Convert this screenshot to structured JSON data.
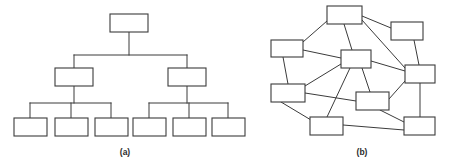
{
  "figure": {
    "background_color": "#ffffff",
    "stroke_color": "#3b3b3b",
    "node_fill_color": "#ffffff",
    "width": 449,
    "height": 165,
    "captions": [
      {
        "id": "caption-a",
        "label": "(a)",
        "x": 125,
        "y": 155
      },
      {
        "id": "caption-b",
        "label": "(b)",
        "x": 362,
        "y": 155
      }
    ],
    "panels": [
      {
        "id": "panel-a",
        "caption": "(a)",
        "diagram_type": "hierarchical-tree",
        "node_count": 9,
        "edge_count": 8,
        "nodes": [
          {
            "id": "a-n1",
            "role": "root",
            "x": 110,
            "y": 14,
            "w": 38,
            "h": 18
          },
          {
            "id": "a-n2",
            "role": "branch",
            "x": 55,
            "y": 68,
            "w": 38,
            "h": 18
          },
          {
            "id": "a-n3",
            "role": "branch",
            "x": 168,
            "y": 68,
            "w": 38,
            "h": 18
          },
          {
            "id": "a-n4",
            "role": "leaf",
            "x": 14,
            "y": 118,
            "w": 33,
            "h": 18
          },
          {
            "id": "a-n5",
            "role": "leaf",
            "x": 55,
            "y": 118,
            "w": 33,
            "h": 18
          },
          {
            "id": "a-n6",
            "role": "leaf",
            "x": 95,
            "y": 118,
            "w": 33,
            "h": 18
          },
          {
            "id": "a-n7",
            "role": "leaf",
            "x": 133,
            "y": 118,
            "w": 33,
            "h": 18
          },
          {
            "id": "a-n8",
            "role": "leaf",
            "x": 173,
            "y": 118,
            "w": 33,
            "h": 18
          },
          {
            "id": "a-n9",
            "role": "leaf",
            "x": 212,
            "y": 118,
            "w": 33,
            "h": 18
          }
        ],
        "trunk_segments": [
          {
            "id": "a-e1",
            "kind": "vertical",
            "x1": 129,
            "y1": 32,
            "x2": 129,
            "y2": 55
          },
          {
            "id": "a-e2",
            "kind": "horizontal",
            "x1": 74,
            "y1": 55,
            "x2": 187,
            "y2": 55
          },
          {
            "id": "a-e3",
            "kind": "vertical",
            "x1": 74,
            "y1": 55,
            "x2": 74,
            "y2": 68
          },
          {
            "id": "a-e4",
            "kind": "vertical",
            "x1": 187,
            "y1": 55,
            "x2": 187,
            "y2": 68
          },
          {
            "id": "a-e5",
            "kind": "vertical",
            "x1": 74,
            "y1": 86,
            "x2": 74,
            "y2": 103
          },
          {
            "id": "a-e6",
            "kind": "horizontal",
            "x1": 30,
            "y1": 103,
            "x2": 111,
            "y2": 103
          },
          {
            "id": "a-e7",
            "kind": "vertical",
            "x1": 30,
            "y1": 103,
            "x2": 30,
            "y2": 118
          },
          {
            "id": "a-e8",
            "kind": "vertical",
            "x1": 71,
            "y1": 103,
            "x2": 71,
            "y2": 118
          },
          {
            "id": "a-e9",
            "kind": "vertical",
            "x1": 111,
            "y1": 103,
            "x2": 111,
            "y2": 118
          },
          {
            "id": "a-e10",
            "kind": "vertical",
            "x1": 187,
            "y1": 86,
            "x2": 187,
            "y2": 103
          },
          {
            "id": "a-e11",
            "kind": "horizontal",
            "x1": 149,
            "y1": 103,
            "x2": 228,
            "y2": 103
          },
          {
            "id": "a-e12",
            "kind": "vertical",
            "x1": 149,
            "y1": 103,
            "x2": 149,
            "y2": 118
          },
          {
            "id": "a-e13",
            "kind": "vertical",
            "x1": 189,
            "y1": 103,
            "x2": 189,
            "y2": 118
          },
          {
            "id": "a-e14",
            "kind": "vertical",
            "x1": 228,
            "y1": 103,
            "x2": 228,
            "y2": 118
          }
        ]
      },
      {
        "id": "panel-b",
        "caption": "(b)",
        "diagram_type": "mesh-network",
        "node_count": 9,
        "edge_count": 17,
        "nodes": [
          {
            "id": "b-n1",
            "role": "mesh-node",
            "x": 327,
            "y": 6,
            "w": 35,
            "h": 18
          },
          {
            "id": "b-n2",
            "role": "mesh-node",
            "x": 391,
            "y": 22,
            "w": 32,
            "h": 18
          },
          {
            "id": "b-n3",
            "role": "mesh-node",
            "x": 271,
            "y": 40,
            "w": 32,
            "h": 17
          },
          {
            "id": "b-n4",
            "role": "mesh-node",
            "x": 341,
            "y": 50,
            "w": 30,
            "h": 18
          },
          {
            "id": "b-n5",
            "role": "mesh-node",
            "x": 405,
            "y": 65,
            "w": 30,
            "h": 18
          },
          {
            "id": "b-n6",
            "role": "mesh-node",
            "x": 271,
            "y": 84,
            "w": 34,
            "h": 18
          },
          {
            "id": "b-n7",
            "role": "mesh-node",
            "x": 356,
            "y": 92,
            "w": 33,
            "h": 18
          },
          {
            "id": "b-n8",
            "role": "mesh-node",
            "x": 310,
            "y": 117,
            "w": 33,
            "h": 18
          },
          {
            "id": "b-n9",
            "role": "mesh-node",
            "x": 404,
            "y": 117,
            "w": 31,
            "h": 18
          }
        ],
        "edges": [
          {
            "id": "b-e1",
            "from": "b-n1",
            "to": "b-n3",
            "x1": 327,
            "y1": 21,
            "x2": 303,
            "y2": 42
          },
          {
            "id": "b-e2",
            "from": "b-n1",
            "to": "b-n4",
            "x1": 344,
            "y1": 24,
            "x2": 352,
            "y2": 50
          },
          {
            "id": "b-e3",
            "from": "b-n1",
            "to": "b-n2",
            "x1": 362,
            "y1": 16,
            "x2": 391,
            "y2": 28
          },
          {
            "id": "b-e4",
            "from": "b-n1",
            "to": "b-n5",
            "x1": 362,
            "y1": 20,
            "x2": 405,
            "y2": 68
          },
          {
            "id": "b-e5",
            "from": "b-n2",
            "to": "b-n5",
            "x1": 414,
            "y1": 40,
            "x2": 419,
            "y2": 65
          },
          {
            "id": "b-e6",
            "from": "b-n3",
            "to": "b-n4",
            "x1": 303,
            "y1": 50,
            "x2": 341,
            "y2": 58
          },
          {
            "id": "b-e7",
            "from": "b-n3",
            "to": "b-n6",
            "x1": 283,
            "y1": 57,
            "x2": 288,
            "y2": 84
          },
          {
            "id": "b-e8",
            "from": "b-n4",
            "to": "b-n5",
            "x1": 371,
            "y1": 61,
            "x2": 405,
            "y2": 71
          },
          {
            "id": "b-e9",
            "from": "b-n4",
            "to": "b-n6",
            "x1": 341,
            "y1": 64,
            "x2": 305,
            "y2": 86
          },
          {
            "id": "b-e10",
            "from": "b-n4",
            "to": "b-n7",
            "x1": 362,
            "y1": 68,
            "x2": 370,
            "y2": 92
          },
          {
            "id": "b-e11",
            "from": "b-n4",
            "to": "b-n8",
            "x1": 350,
            "y1": 68,
            "x2": 327,
            "y2": 117
          },
          {
            "id": "b-e12",
            "from": "b-n5",
            "to": "b-n7",
            "x1": 405,
            "y1": 81,
            "x2": 389,
            "y2": 99
          },
          {
            "id": "b-e13",
            "from": "b-n5",
            "to": "b-n9",
            "x1": 420,
            "y1": 83,
            "x2": 420,
            "y2": 117
          },
          {
            "id": "b-e14",
            "from": "b-n6",
            "to": "b-n7",
            "x1": 305,
            "y1": 93,
            "x2": 356,
            "y2": 101
          },
          {
            "id": "b-e15",
            "from": "b-n6",
            "to": "b-n8",
            "x1": 281,
            "y1": 102,
            "x2": 311,
            "y2": 120
          },
          {
            "id": "b-e16",
            "from": "b-n7",
            "to": "b-n9",
            "x1": 380,
            "y1": 110,
            "x2": 404,
            "y2": 122
          },
          {
            "id": "b-e17",
            "from": "b-n8",
            "to": "b-n9",
            "x1": 343,
            "y1": 125,
            "x2": 404,
            "y2": 130
          }
        ]
      }
    ]
  }
}
